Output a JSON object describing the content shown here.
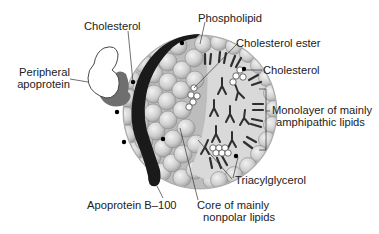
{
  "figure": {
    "type": "lipoprotein-structure-diagram",
    "colors": {
      "background": "#ffffff",
      "sphere_fill": "#cfcfcf",
      "sphere_stroke": "#8a8a8a",
      "core_fill": "#d6d6d6",
      "apoprotein_b100": "#1a1a1a",
      "peripheral_apoprotein_fill": "#ffffff",
      "peripheral_apoprotein_shadow": "#7a7a7a",
      "lipid_tail": "#333333",
      "cholesterol_dot": "#000000",
      "ester_circle": "#ffffff"
    }
  },
  "labels": {
    "cholesterol_top": "Cholesterol",
    "phospholipid": "Phospholipid",
    "cholesterol_ester": "Cholesterol ester",
    "cholesterol_right": "Cholesterol",
    "peripheral_apoprotein_line1": "Peripheral",
    "peripheral_apoprotein_line2": "apoprotein",
    "monolayer_line1": "Monolayer of mainly",
    "monolayer_line2": "amphipathic lipids",
    "triacylglycerol": "Triacylglycerol",
    "apoprotein_b100": "Apoprotein B–100",
    "core_line1": "Core of mainly",
    "core_line2": "nonpolar lipids"
  }
}
